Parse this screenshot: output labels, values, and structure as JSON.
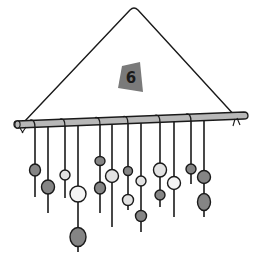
{
  "illustration": {
    "subject": "hanging mobile with beads on strands",
    "badge": {
      "label": "6",
      "color": "#7a7a7a"
    },
    "colors": {
      "line": "#1a1a1a",
      "rod": "#b8b8b8",
      "bead_dark": "#858585",
      "bead_light": "#e2e2e2",
      "bead_white": "#f4f4f4"
    },
    "strand_count": 12,
    "strands": [
      {
        "beads": [
          "dark"
        ]
      },
      {
        "beads": [
          "dark"
        ]
      },
      {
        "beads": [
          "light"
        ]
      },
      {
        "beads": [
          "white",
          "dark"
        ]
      },
      {
        "beads": [
          "dark",
          "dark"
        ]
      },
      {
        "beads": [
          "light"
        ]
      },
      {
        "beads": [
          "dark",
          "light"
        ]
      },
      {
        "beads": [
          "light",
          "dark"
        ]
      },
      {
        "beads": [
          "light",
          "dark"
        ]
      },
      {
        "beads": [
          "white"
        ]
      },
      {
        "beads": [
          "dark"
        ]
      },
      {
        "beads": [
          "dark",
          "dark"
        ]
      }
    ]
  }
}
